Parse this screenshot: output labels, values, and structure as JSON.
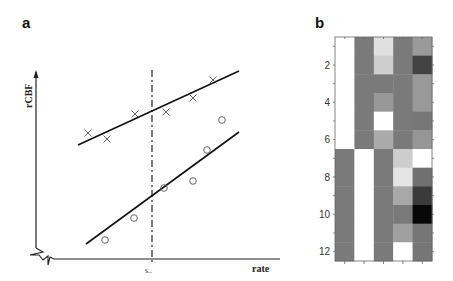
{
  "panels": {
    "a": {
      "label": "a"
    },
    "b": {
      "label": "b"
    }
  },
  "chart_data": [
    {
      "panel": "a",
      "type": "scatter",
      "title": "",
      "xlabel": "rate",
      "ylabel": "rCBF",
      "x_annotation": "s..",
      "axis_break": true,
      "grid": false,
      "legend": null,
      "vertical_reference_line": {
        "x_label": "s..",
        "style": "dash-dot"
      },
      "series": [
        {
          "name": "upper (X markers)",
          "marker": "x",
          "points_px": [
            [
              88,
              133
            ],
            [
              107,
              139
            ],
            [
              135,
              114
            ],
            [
              166,
              112
            ],
            [
              193,
              98
            ],
            [
              213,
              80
            ]
          ],
          "fit_line_px": [
            [
              78,
              145
            ],
            [
              239,
              71
            ]
          ]
        },
        {
          "name": "lower (O markers)",
          "marker": "o",
          "points_px": [
            [
              105,
              240
            ],
            [
              134,
              218
            ],
            [
              164,
              188
            ],
            [
              193,
              181
            ],
            [
              207,
              150
            ],
            [
              222,
              120
            ]
          ],
          "fit_line_px": [
            [
              86,
              244
            ],
            [
              239,
              132
            ]
          ]
        }
      ]
    },
    {
      "panel": "b",
      "type": "heatmap",
      "title": "",
      "xlabel": "",
      "ylabel": "",
      "colormap": "gray",
      "rows": 12,
      "cols": 5,
      "yticks": [
        "2",
        "4",
        "6",
        "8",
        "10",
        "12"
      ],
      "values_gray_0_255": [
        [
          255,
          122,
          224,
          122,
          154
        ],
        [
          255,
          122,
          206,
          122,
          66
        ],
        [
          255,
          122,
          122,
          122,
          153
        ],
        [
          255,
          122,
          152,
          122,
          153
        ],
        [
          255,
          122,
          255,
          122,
          119
        ],
        [
          255,
          122,
          170,
          122,
          150
        ],
        [
          122,
          255,
          122,
          205,
          255
        ],
        [
          122,
          255,
          122,
          228,
          112
        ],
        [
          122,
          255,
          122,
          168,
          58
        ],
        [
          122,
          255,
          122,
          122,
          8
        ],
        [
          122,
          255,
          122,
          160,
          118
        ],
        [
          122,
          255,
          122,
          255,
          118
        ]
      ]
    }
  ]
}
